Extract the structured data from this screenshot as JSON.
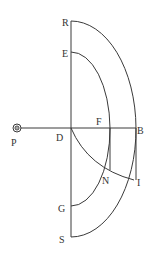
{
  "diagram": {
    "type": "geometric-construction",
    "stroke_color": "#3a3a3a",
    "background": "#ffffff",
    "labels": {
      "R": "R",
      "E": "E",
      "P": "P",
      "D": "D",
      "F": "F",
      "B": "B",
      "N": "N",
      "I": "I",
      "G": "G",
      "S": "S"
    },
    "points": {
      "R": [
        71,
        21
      ],
      "E": [
        71,
        52
      ],
      "D": [
        71,
        128
      ],
      "F": [
        110,
        128
      ],
      "B": [
        136,
        128
      ],
      "N": [
        110,
        170
      ],
      "I": [
        134,
        180
      ],
      "G": [
        71,
        206
      ],
      "S": [
        71,
        237
      ],
      "P": [
        17,
        128
      ]
    },
    "elements": [
      "vertical line R-S",
      "horizontal line P-B",
      "outer arc R-B-S",
      "inner arc E-F-G",
      "arc D-N-I",
      "vertical segment F-N",
      "vertical segment B-I",
      "observer symbol at P"
    ]
  }
}
